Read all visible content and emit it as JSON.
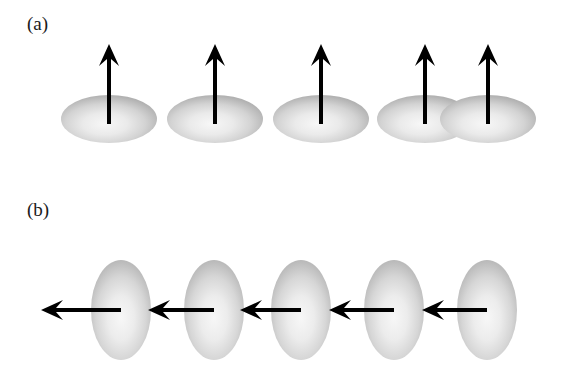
{
  "figure": {
    "width": 561,
    "height": 374,
    "background_color": "#ffffff",
    "ink_color": "#000000"
  },
  "panels": [
    {
      "id": "a",
      "label": "(a)",
      "label_x": 27,
      "label_y": 14,
      "ellipse_orientation": "horizontal",
      "arrow_direction": "up",
      "count": 5
    },
    {
      "id": "b",
      "label": "(b)",
      "label_x": 27,
      "label_y": 200,
      "ellipse_orientation": "vertical",
      "arrow_direction": "left",
      "count": 5
    }
  ],
  "shading": {
    "edge_color": "#9a9a9a",
    "mid_color": "#c9c9c9",
    "highlight_color": "#f4f4f4",
    "outer_color": "#a8a8a8"
  },
  "panel_a_ellipses": [
    {
      "cx": 109,
      "cy": 119,
      "rx": 48,
      "ry": 24
    },
    {
      "cx": 215,
      "cy": 119,
      "rx": 48,
      "ry": 24
    },
    {
      "cx": 321,
      "cy": 119,
      "rx": 48,
      "ry": 24
    },
    {
      "cx": 425,
      "cy": 119,
      "rx": 48,
      "ry": 24
    },
    {
      "cx": 488,
      "cy": 119,
      "rx": 48,
      "ry": 24
    }
  ],
  "panel_a_arrows": [
    {
      "x": 109,
      "y_tail": 124,
      "y_tip": 44
    },
    {
      "x": 215,
      "y_tail": 124,
      "y_tip": 44
    },
    {
      "x": 321,
      "y_tail": 124,
      "y_tip": 44
    },
    {
      "x": 425,
      "y_tail": 124,
      "y_tip": 44
    },
    {
      "x": 488,
      "y_tail": 124,
      "y_tip": 44
    }
  ],
  "panel_b_ellipses": [
    {
      "cx": 121,
      "cy": 310,
      "rx": 30,
      "ry": 50
    },
    {
      "cx": 214,
      "cy": 310,
      "rx": 30,
      "ry": 50
    },
    {
      "cx": 301,
      "cy": 310,
      "rx": 30,
      "ry": 50
    },
    {
      "cx": 394,
      "cy": 310,
      "rx": 30,
      "ry": 50
    },
    {
      "cx": 487,
      "cy": 310,
      "rx": 30,
      "ry": 50
    }
  ],
  "panel_b_arrows": [
    {
      "y": 310,
      "x_tail": 121,
      "x_tip": 41
    },
    {
      "y": 310,
      "x_tail": 214,
      "x_tip": 148
    },
    {
      "y": 310,
      "x_tail": 301,
      "x_tip": 240
    },
    {
      "y": 310,
      "x_tail": 394,
      "x_tip": 329
    },
    {
      "y": 310,
      "x_tail": 487,
      "x_tip": 422
    }
  ],
  "arrow_style": {
    "shaft_width": 4,
    "head_length": 22,
    "head_half_width": 10,
    "notch_depth": 7
  }
}
